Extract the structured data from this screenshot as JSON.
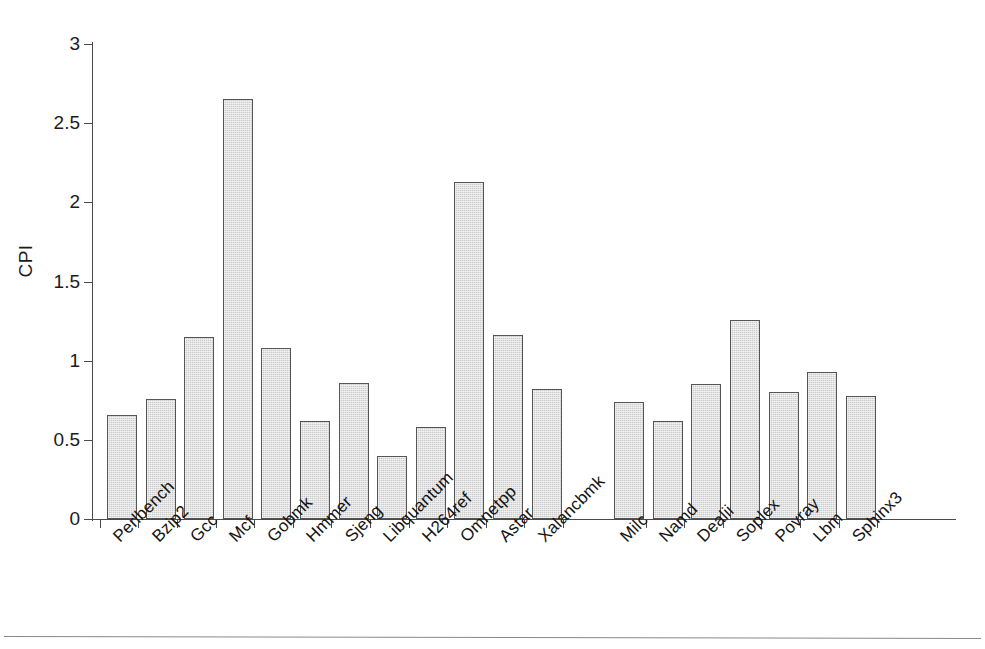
{
  "chart_data": {
    "type": "bar",
    "title": "",
    "xlabel": "",
    "ylabel": "CPI",
    "ylim": [
      0,
      3
    ],
    "yticks": [
      0,
      0.5,
      1,
      1.5,
      2,
      2.5,
      3
    ],
    "ytick_labels": [
      "0",
      "0.5",
      "1",
      "1.5",
      "2",
      "2.5",
      "3"
    ],
    "grid": false,
    "legend": "none",
    "bar_color": "#cccccc",
    "bar_edge_color": "#555555",
    "axis_color": "#4a4a4a",
    "groups": [
      {
        "name": "integer-benchmarks",
        "categories": [
          "Perlbench",
          "Bzip2",
          "Gcc",
          "Mcf",
          "Gobmk",
          "Hmmer",
          "Sjeng",
          "Libquantum",
          "H264ref",
          "Omnetpp",
          "Astar",
          "Xalancbmk"
        ],
        "values": [
          0.66,
          0.76,
          1.15,
          2.65,
          1.08,
          0.62,
          0.86,
          0.4,
          0.58,
          2.13,
          1.16,
          0.82
        ]
      },
      {
        "name": "floating-point-benchmarks",
        "categories": [
          "Milc",
          "Namd",
          "Dealii",
          "Soplex",
          "Povray",
          "Lbm",
          "Sphinx3"
        ],
        "values": [
          0.74,
          0.62,
          0.85,
          1.26,
          0.8,
          0.93,
          0.78
        ]
      }
    ],
    "categories": [
      "Perlbench",
      "Bzip2",
      "Gcc",
      "Mcf",
      "Gobmk",
      "Hmmer",
      "Sjeng",
      "Libquantum",
      "H264ref",
      "Omnetpp",
      "Astar",
      "Xalancbmk",
      "Milc",
      "Namd",
      "Dealii",
      "Soplex",
      "Povray",
      "Lbm",
      "Sphinx3"
    ],
    "values": [
      0.66,
      0.76,
      1.15,
      2.65,
      1.08,
      0.62,
      0.86,
      0.4,
      0.58,
      2.13,
      1.16,
      0.82,
      0.74,
      0.62,
      0.85,
      1.26,
      0.8,
      0.93,
      0.78
    ]
  }
}
